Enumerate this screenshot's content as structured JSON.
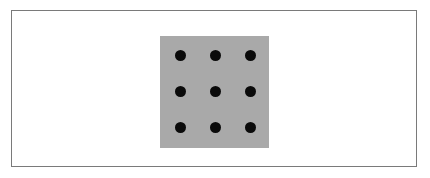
{
  "figure": {
    "frame_border_color": "#7a7a7a",
    "panel_color": "#a9a9a9",
    "dot_color": "#0a0a0a",
    "grid": {
      "rows": 3,
      "cols": 3
    },
    "dots": [
      {
        "row": 1,
        "col": 1,
        "x": 180,
        "y": 55
      },
      {
        "row": 1,
        "col": 2,
        "x": 215,
        "y": 55
      },
      {
        "row": 1,
        "col": 3,
        "x": 250,
        "y": 55
      },
      {
        "row": 2,
        "col": 1,
        "x": 180,
        "y": 91
      },
      {
        "row": 2,
        "col": 2,
        "x": 215,
        "y": 91
      },
      {
        "row": 2,
        "col": 3,
        "x": 250,
        "y": 91
      },
      {
        "row": 3,
        "col": 1,
        "x": 180,
        "y": 127
      },
      {
        "row": 3,
        "col": 2,
        "x": 215,
        "y": 127
      },
      {
        "row": 3,
        "col": 3,
        "x": 250,
        "y": 127
      }
    ]
  }
}
